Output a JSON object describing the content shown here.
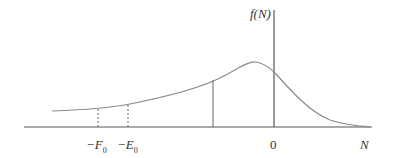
{
  "diagram": {
    "type": "distribution-curve",
    "y_axis_label": "f(N)",
    "x_axis_label": "N",
    "origin_label": "0",
    "markers": [
      {
        "label": "−F",
        "subscript": "0",
        "style": "dashed"
      },
      {
        "label": "−E",
        "subscript": "0",
        "style": "dashed"
      },
      {
        "label": "",
        "style": "solid"
      }
    ],
    "colors": {
      "curve": "#8a8a8a",
      "axis": "#555555",
      "text": "#333333"
    }
  }
}
